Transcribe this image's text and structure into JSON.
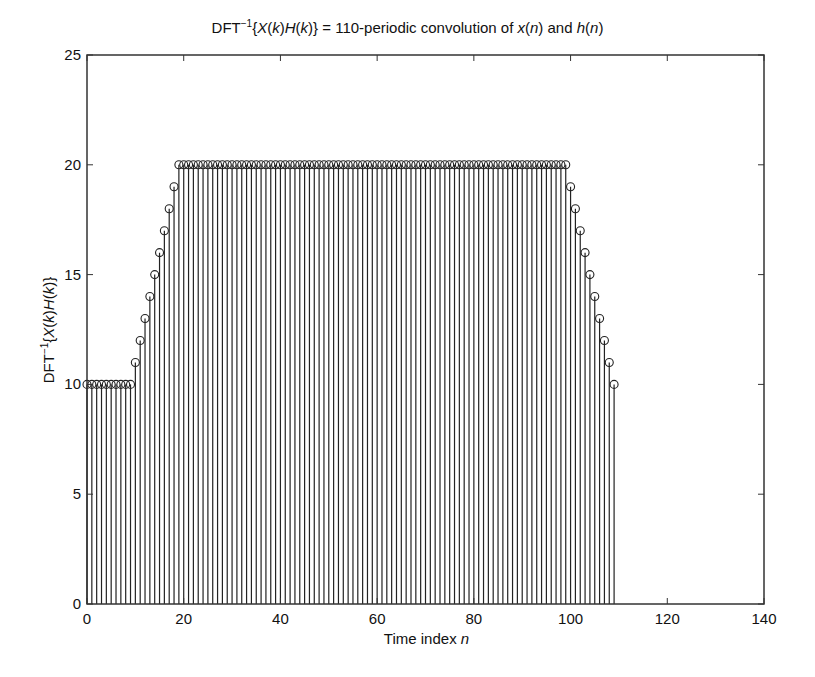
{
  "chart_data": {
    "type": "stem",
    "xlabel": "Time index n",
    "ylabel": "DFT^-1{X(k)H(k)}",
    "xlim": [
      0,
      140
    ],
    "ylim": [
      0,
      25
    ],
    "xticks": [
      0,
      20,
      40,
      60,
      80,
      100,
      120,
      140
    ],
    "yticks": [
      0,
      5,
      10,
      15,
      20,
      25
    ],
    "grid": false,
    "legend": null,
    "x": [
      0,
      1,
      2,
      3,
      4,
      5,
      6,
      7,
      8,
      9,
      10,
      11,
      12,
      13,
      14,
      15,
      16,
      17,
      18,
      19,
      20,
      21,
      22,
      23,
      24,
      25,
      26,
      27,
      28,
      29,
      30,
      31,
      32,
      33,
      34,
      35,
      36,
      37,
      38,
      39,
      40,
      41,
      42,
      43,
      44,
      45,
      46,
      47,
      48,
      49,
      50,
      51,
      52,
      53,
      54,
      55,
      56,
      57,
      58,
      59,
      60,
      61,
      62,
      63,
      64,
      65,
      66,
      67,
      68,
      69,
      70,
      71,
      72,
      73,
      74,
      75,
      76,
      77,
      78,
      79,
      80,
      81,
      82,
      83,
      84,
      85,
      86,
      87,
      88,
      89,
      90,
      91,
      92,
      93,
      94,
      95,
      96,
      97,
      98,
      99,
      100,
      101,
      102,
      103,
      104,
      105,
      106,
      107,
      108,
      109
    ],
    "values": [
      10,
      10,
      10,
      10,
      10,
      10,
      10,
      10,
      10,
      10,
      11,
      12,
      13,
      14,
      15,
      16,
      17,
      18,
      19,
      20,
      20,
      20,
      20,
      20,
      20,
      20,
      20,
      20,
      20,
      20,
      20,
      20,
      20,
      20,
      20,
      20,
      20,
      20,
      20,
      20,
      20,
      20,
      20,
      20,
      20,
      20,
      20,
      20,
      20,
      20,
      20,
      20,
      20,
      20,
      20,
      20,
      20,
      20,
      20,
      20,
      20,
      20,
      20,
      20,
      20,
      20,
      20,
      20,
      20,
      20,
      20,
      20,
      20,
      20,
      20,
      20,
      20,
      20,
      20,
      20,
      20,
      20,
      20,
      20,
      20,
      20,
      20,
      20,
      20,
      20,
      20,
      20,
      20,
      20,
      20,
      20,
      20,
      20,
      20,
      20,
      19,
      18,
      17,
      16,
      15,
      14,
      13,
      12,
      11,
      10
    ]
  },
  "labels": {
    "title_prefix": "DFT",
    "title_sup": "−1",
    "title_open": "{",
    "title_X": "X",
    "title_k1": "(k)",
    "title_H": "H",
    "title_k2": "(k)",
    "title_mid": "} = 110-periodic convolution of ",
    "title_x": "x",
    "title_n1": "(n)",
    "title_and": " and ",
    "title_h": "h",
    "title_n2": "(n)",
    "xlabel_text": "Time index ",
    "xlabel_var": "n"
  },
  "colors": {
    "stem": "#222222",
    "axes": "#333333",
    "background": "#ffffff"
  }
}
